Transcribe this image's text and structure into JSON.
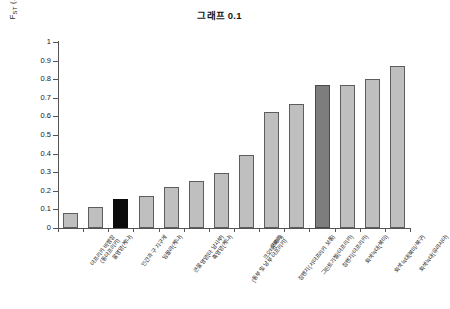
{
  "chart_data": {
    "type": "bar",
    "title": "그래프 0.1",
    "xlabel": "",
    "ylabel": "F<sub>ST</sub> (또는 N<sub>ST</sub> 또는 K<sub>ST</sub>)",
    "ylabel_plain": "FST (또는 NST 또는 KST)",
    "ylim": [
      0,
      1
    ],
    "ytick_labels": [
      "1",
      "0.9",
      "0.8",
      "0.7",
      "0.6",
      "0.5",
      "0.4",
      "0.3",
      "0.2",
      "0.1",
      "0"
    ],
    "ytick_values": [
      1,
      0.9,
      0.8,
      0.7,
      0.6,
      0.5,
      0.4,
      0.3,
      0.2,
      0.1,
      0
    ],
    "grid": false,
    "legend": null,
    "categories": [
      "아프리카 비팽창\n(동아프리카)",
      "물영양(케냐)",
      "인간과 구 지구계",
      "임팔라(케냐)",
      "큰물영양(아 남사부)",
      "흑영양(케냐)",
      "코끼리\n(동부 및 남부 아프리카)",
      "크오테(북미)",
      "침팬지(서아프리카 보통)",
      "그린트기젤(아프리카)",
      "침팬지(아프리카)",
      "회색늑대(북미)",
      "회색늑대(북미/북구)",
      "회색늑대(유라시아)"
    ],
    "category_lines": [
      [
        "아프리카 비팽창",
        "(동아프리카)"
      ],
      [
        "물영양(케냐)",
        ""
      ],
      [
        "인간과 구 지구계",
        ""
      ],
      [
        "임팔라(케냐)",
        ""
      ],
      [
        "큰물영양(아 남사부)",
        ""
      ],
      [
        "흑영양(케냐)",
        ""
      ],
      [
        "코끼리",
        "(동부 및 남부 아프리카)"
      ],
      [
        "크오테(북미)",
        ""
      ],
      [
        "침팬지(서아프리카 보통)",
        ""
      ],
      [
        "그린트기젤(아프리카)",
        ""
      ],
      [
        "침팬지(아프리카)",
        ""
      ],
      [
        "회색늑대(북미)",
        ""
      ],
      [
        "회색늑대(북미/북구)",
        ""
      ],
      [
        "회색늑대(유라시아)",
        ""
      ]
    ],
    "values": [
      0.08,
      0.115,
      0.155,
      0.17,
      0.22,
      0.255,
      0.295,
      0.395,
      0.625,
      0.665,
      0.77,
      0.77,
      0.8,
      0.87
    ],
    "bar_styles": [
      "light",
      "light",
      "black",
      "light",
      "light",
      "light",
      "light",
      "light",
      "light",
      "light",
      "dark",
      "light",
      "light",
      "light"
    ],
    "colors": {
      "light": "#bfbfbf",
      "black": "#0b0b0b",
      "dark": "#7d7d7d",
      "bar_border": "#5d5d5d",
      "axis": "#555555",
      "text": "#1a1a1a",
      "background": "#ffffff"
    }
  }
}
